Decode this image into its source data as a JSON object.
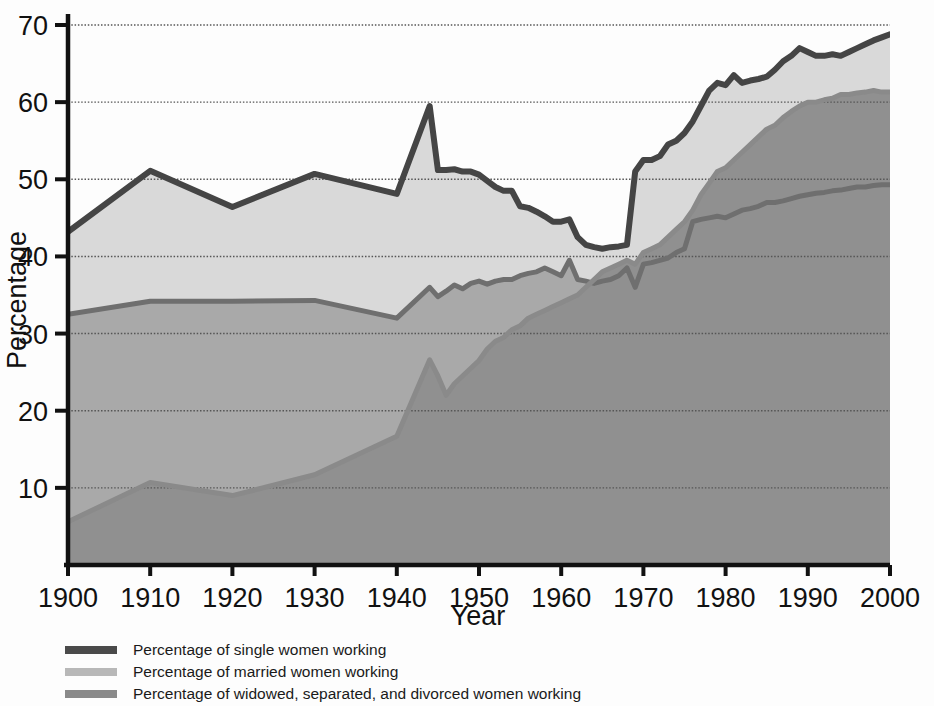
{
  "chart_data": {
    "type": "area",
    "title": "",
    "subtitle": "",
    "xlabel": "Year",
    "ylabel": "Percentage",
    "xlim": [
      1900,
      2000
    ],
    "ylim": [
      0,
      72
    ],
    "xticks": [
      1900,
      1910,
      1920,
      1930,
      1940,
      1950,
      1960,
      1970,
      1980,
      1990,
      2000
    ],
    "yticks": [
      10,
      20,
      30,
      40,
      50,
      60,
      70
    ],
    "grid": true,
    "grid_axis": "y",
    "stacked": false,
    "legend_position": "below",
    "x": [
      1900,
      1910,
      1920,
      1930,
      1940,
      1944,
      1945,
      1946,
      1947,
      1948,
      1949,
      1950,
      1951,
      1952,
      1953,
      1954,
      1955,
      1956,
      1957,
      1958,
      1959,
      1960,
      1961,
      1962,
      1963,
      1964,
      1965,
      1966,
      1967,
      1968,
      1969,
      1970,
      1971,
      1972,
      1973,
      1974,
      1975,
      1976,
      1977,
      1978,
      1979,
      1980,
      1981,
      1982,
      1983,
      1984,
      1985,
      1986,
      1987,
      1988,
      1989,
      1990,
      1991,
      1992,
      1993,
      1994,
      1995,
      1996,
      1997,
      1998,
      1999,
      2000
    ],
    "series": [
      {
        "name": "Percentage of single women working",
        "key": "single",
        "color": "#4a4a4a",
        "fill": "#d9d9d9",
        "values": [
          43.2,
          51.1,
          46.4,
          50.7,
          48.1,
          59.5,
          51.2,
          51.2,
          51.3,
          51.0,
          51.0,
          50.6,
          49.8,
          49.0,
          48.5,
          48.5,
          46.5,
          46.3,
          45.8,
          45.2,
          44.5,
          44.5,
          44.8,
          42.5,
          41.5,
          41.2,
          41.0,
          41.2,
          41.3,
          41.5,
          51.0,
          52.5,
          52.5,
          53.0,
          54.5,
          55.0,
          56.0,
          57.5,
          59.5,
          61.5,
          62.5,
          62.2,
          63.5,
          62.5,
          62.8,
          63.0,
          63.3,
          64.2,
          65.3,
          66.0,
          67.0,
          66.5,
          66.0,
          66.0,
          66.2,
          66.0,
          66.5,
          67.0,
          67.5,
          68.0,
          68.4,
          68.8
        ]
      },
      {
        "name": "Percentage of married women working",
        "key": "married",
        "color": "#8f8f8f",
        "fill": "#b5b5b5",
        "values": [
          5.6,
          10.7,
          9.0,
          11.7,
          16.7,
          26.6,
          24.5,
          22.0,
          23.5,
          24.5,
          25.5,
          26.5,
          28.0,
          29.0,
          29.5,
          30.5,
          31.0,
          32.0,
          32.5,
          33.0,
          33.5,
          34.0,
          34.5,
          35.0,
          36.0,
          37.0,
          38.0,
          38.5,
          39.0,
          39.5,
          39.0,
          40.5,
          41.0,
          41.5,
          42.5,
          43.5,
          44.5,
          46.0,
          48.0,
          49.5,
          51.0,
          51.5,
          52.5,
          53.5,
          54.5,
          55.5,
          56.5,
          57.0,
          58.0,
          58.8,
          59.5,
          60.0,
          60.0,
          60.3,
          60.5,
          61.0,
          61.0,
          61.2,
          61.3,
          61.5,
          61.3,
          61.3
        ]
      },
      {
        "name": "Percentage of widowed, separated, and divorced women working",
        "key": "widowed",
        "color": "#6b6b6b",
        "fill": "#969696",
        "values": [
          32.5,
          34.2,
          34.2,
          34.3,
          32.0,
          36.0,
          34.8,
          35.5,
          36.3,
          35.8,
          36.5,
          36.8,
          36.4,
          36.8,
          37.0,
          37.0,
          37.5,
          37.8,
          38.0,
          38.5,
          38.0,
          37.5,
          39.5,
          37.0,
          36.8,
          36.5,
          36.8,
          37.0,
          37.5,
          38.5,
          36.0,
          39.0,
          39.2,
          39.5,
          39.8,
          40.5,
          41.0,
          44.5,
          44.8,
          45.0,
          45.2,
          45.0,
          45.5,
          46.0,
          46.2,
          46.5,
          47.0,
          47.0,
          47.2,
          47.5,
          47.8,
          48.0,
          48.2,
          48.3,
          48.5,
          48.6,
          48.8,
          49.0,
          49.0,
          49.2,
          49.3,
          49.3
        ]
      }
    ]
  },
  "axes": {
    "y_label": "Percentage",
    "x_label": "Year",
    "y_tick_labels": [
      "70",
      "60",
      "50",
      "40",
      "30",
      "20",
      "10"
    ],
    "x_tick_labels": [
      "1900",
      "1910",
      "1920",
      "1930",
      "1940",
      "1950",
      "1960",
      "1970",
      "1980",
      "1990",
      "2000"
    ]
  },
  "legend": {
    "items": [
      {
        "label": "Percentage of single women working",
        "swatch_color": "#4a4a4a"
      },
      {
        "label": "Percentage of married women working",
        "swatch_color": "#b8b8b8"
      },
      {
        "label": "Percentage of widowed, separated, and divorced women working",
        "swatch_color": "#8a8a8a"
      }
    ]
  },
  "colors": {
    "band_top": "#d9d9d9",
    "band_middle": "#a9a9a9",
    "band_bottom": "#909090",
    "line_dark": "#4a4a4a",
    "axis": "#111111",
    "gridline": "#555555",
    "background": "#fdfdfd"
  }
}
